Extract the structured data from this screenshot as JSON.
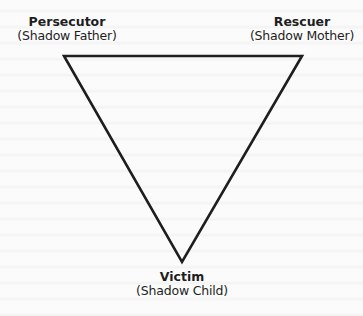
{
  "diagram": {
    "type": "drama-triangle",
    "shape": "inverted-triangle",
    "stroke_color": "#1e1e1e",
    "background_color": "#fbfbfb",
    "vertices": {
      "top_left": {
        "role": "Persecutor",
        "shadow": "(Shadow Father)"
      },
      "top_right": {
        "role": "Rescuer",
        "shadow": "(Shadow Mother)"
      },
      "bottom": {
        "role": "Victim",
        "shadow": "(Shadow Child)"
      }
    }
  }
}
